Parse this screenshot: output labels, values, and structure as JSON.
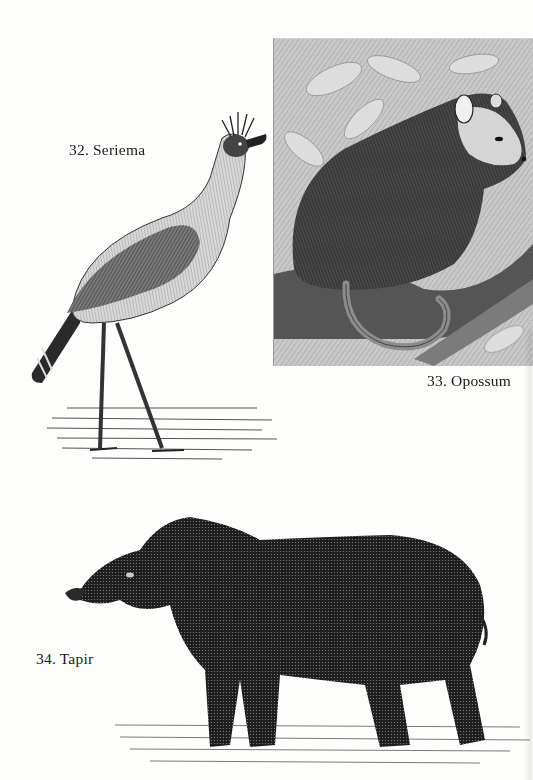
{
  "page": {
    "background": "#fdfdfc",
    "ink_color": "#1a1a1a"
  },
  "plates": [
    {
      "number": "32.",
      "name": "Seriema",
      "caption": "32. Seriema",
      "subject_icon": "bird-engraving"
    },
    {
      "number": "33.",
      "name": "Opossum",
      "caption": "33. Opossum",
      "subject_icon": "opossum-engraving"
    },
    {
      "number": "34.",
      "name": "Tapir",
      "caption": "34. Tapir",
      "subject_icon": "tapir-engraving"
    }
  ]
}
